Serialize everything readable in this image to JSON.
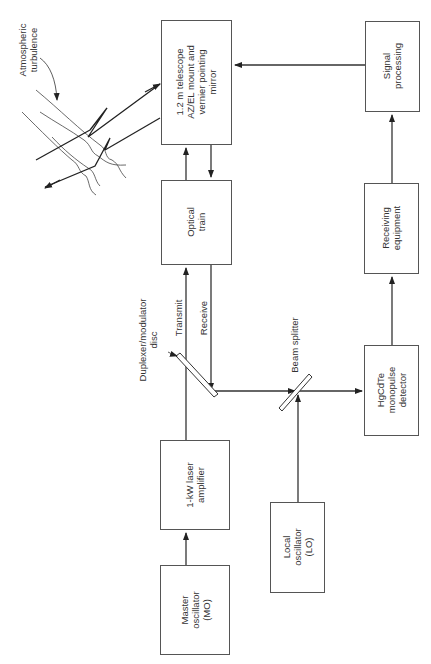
{
  "diagram": {
    "type": "block-diagram",
    "orientation": "rotated-90-ccw",
    "blocks": [
      {
        "id": "telescope",
        "label": "1.2 m telescope\nAZ/EL mount and\nvernier pointing\nmirror"
      },
      {
        "id": "signal_processing",
        "label": "Signal\nprocessing"
      },
      {
        "id": "optical_train",
        "label": "Optical\ntrain"
      },
      {
        "id": "receiving_equipment",
        "label": "Receiving\nequipment"
      },
      {
        "id": "laser_amplifier",
        "label": "1-kW laser\namplifier"
      },
      {
        "id": "local_oscillator",
        "label": "Local\noscillator\n(LO)"
      },
      {
        "id": "master_oscillator",
        "label": "Master\noscillator\n(MO)"
      },
      {
        "id": "detector",
        "label": "HgCdTe\nmonopulse\ndetector"
      }
    ],
    "annotations": {
      "atmospheric_turbulence": "Atmospheric\nturbulence",
      "duplexer": "Duplexer/modulator\ndisc",
      "transmit": "Transmit",
      "receive": "Receive",
      "beam_splitter": "Beam splitter"
    },
    "connections": [
      {
        "from": "master_oscillator",
        "to": "laser_amplifier"
      },
      {
        "from": "laser_amplifier",
        "to": "optical_train",
        "via": "duplexer",
        "label": "Transmit"
      },
      {
        "from": "optical_train",
        "to": "telescope"
      },
      {
        "from": "telescope",
        "to": "optical_train"
      },
      {
        "from": "optical_train",
        "to": "beam_splitter",
        "via": "duplexer",
        "label": "Receive"
      },
      {
        "from": "local_oscillator",
        "to": "beam_splitter"
      },
      {
        "from": "beam_splitter",
        "to": "detector"
      },
      {
        "from": "detector",
        "to": "receiving_equipment"
      },
      {
        "from": "receiving_equipment",
        "to": "signal_processing"
      },
      {
        "from": "signal_processing",
        "to": "telescope"
      }
    ],
    "colors": {
      "line": "#333333",
      "box_border": "#555555",
      "text": "#333333",
      "background": "#ffffff"
    }
  }
}
